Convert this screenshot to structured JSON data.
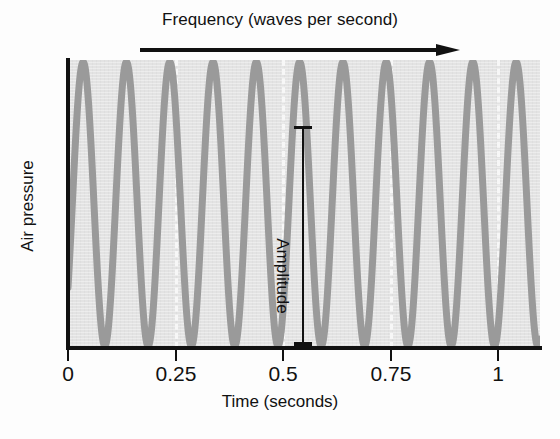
{
  "figure": {
    "top_annotation": {
      "label": "Frequency (waves per second)",
      "arrow_icon": "right-arrow-icon"
    },
    "y_axis_title": "Air pressure",
    "x_axis_title": "Time (seconds)",
    "amplitude_annotation": {
      "label": "Amplitude",
      "x_position_seconds": 0.535
    }
  },
  "chart_data": {
    "type": "line",
    "title": "",
    "subtitle": "",
    "xlabel": "Time (seconds)",
    "ylabel": "Air pressure",
    "xlim": [
      0,
      1.09
    ],
    "ylim": [
      0,
      1
    ],
    "xticks": [
      0,
      0.25,
      0.5,
      0.75,
      1
    ],
    "xtick_labels": [
      "0",
      "0.25",
      "0.5",
      "0.75",
      "1"
    ],
    "yticks": [],
    "ytick_labels": [],
    "grid": "vertical-dashed-white-at-xticks",
    "legend": "none",
    "series": [
      {
        "name": "sound wave",
        "waveform": "sine",
        "frequency_hz": 10,
        "cycles_shown": 10,
        "amplitude_normalized": 1.0,
        "phase_offset_seconds": 0.035,
        "color": "#9a9a9a",
        "line_width_px": 7,
        "peak_times_seconds": [
          0.035,
          0.135,
          0.235,
          0.335,
          0.435,
          0.535,
          0.635,
          0.735,
          0.835,
          0.935
        ],
        "peak_values": [
          1,
          1,
          1,
          1,
          1,
          1,
          1,
          1,
          1,
          1
        ],
        "trough_times_seconds": [
          0.085,
          0.185,
          0.285,
          0.385,
          0.485,
          0.585,
          0.685,
          0.785,
          0.885,
          0.985
        ],
        "trough_values": [
          0,
          0,
          0,
          0,
          0,
          0,
          0,
          0,
          0,
          0
        ]
      }
    ],
    "annotations": [
      {
        "text": "Amplitude",
        "type": "vertical-double-ended-bar",
        "x_seconds": 0.535,
        "from_value": 0,
        "to_value": 1
      },
      {
        "text": "Frequency (waves per second)",
        "type": "horizontal-arrow-above-plot"
      }
    ]
  },
  "colors": {
    "plot_background": "#e3e3e3",
    "wave": "#9a9a9a",
    "axis": "#111111",
    "gridline": "#f7f7f7",
    "text": "#111111",
    "page_background": "#fdfdfd"
  }
}
